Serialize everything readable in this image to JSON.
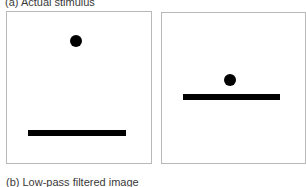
{
  "figure": {
    "caption_a": "(a) Actual stimulus",
    "caption_b": "(b) Low-pass filtered image",
    "panels": [
      {
        "name": "left-stimulus",
        "dot": {
          "cx": 76,
          "cy": 40,
          "diameter": 12
        },
        "bar": {
          "x1": 28,
          "x2": 126,
          "y": 130,
          "thickness": 6
        }
      },
      {
        "name": "right-stimulus",
        "dot": {
          "cx": 230,
          "cy": 80,
          "diameter": 12
        },
        "bar": {
          "x1": 183,
          "x2": 280,
          "y": 94,
          "thickness": 6
        }
      }
    ],
    "colors": {
      "shape": "#000000",
      "frame": "#b8b8b8",
      "background": "#ffffff"
    }
  }
}
